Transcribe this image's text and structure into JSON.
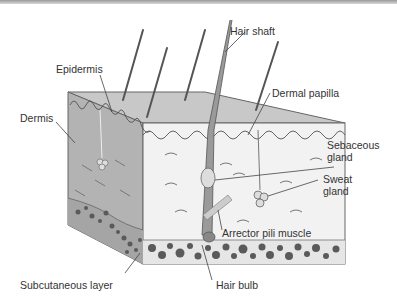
{
  "diagram": {
    "labels": {
      "hair_shaft": "Hair shaft",
      "epidermis": "Epidermis",
      "dermal_papilla": "Dermal papilla",
      "dermis": "Dermis",
      "sebaceous_gland_line1": "Sebaceous",
      "sebaceous_gland_line2": "gland",
      "sweat_gland_line1": "Sweat",
      "sweat_gland_line2": "gland",
      "arrector_pili_muscle": "Arrector pili muscle",
      "subcutaneous_layer": "Subcutaneous layer",
      "hair_bulb": "Hair bulb"
    },
    "colors": {
      "top_face": "#c8c8c8",
      "left_face": "#b3b3b3",
      "front_face": "#f2f2f2",
      "fat_cells": "#5a5a5a",
      "outline": "#555555",
      "label_text": "#333333"
    }
  }
}
